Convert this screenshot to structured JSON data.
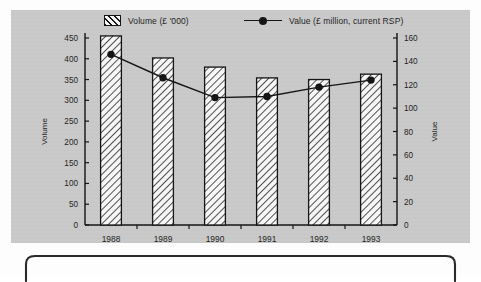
{
  "legend": {
    "items": [
      {
        "label": "Volume (£ '000)",
        "marker": "hatch-swatch"
      },
      {
        "label": "Value (£ million, current RSP)",
        "marker": "line-dot-swatch"
      }
    ]
  },
  "axes": {
    "left_title": "Volume",
    "right_title": "Value",
    "left_ticks": [
      "0",
      "50",
      "100",
      "150",
      "200",
      "250",
      "300",
      "350",
      "400",
      "450"
    ],
    "right_ticks": [
      "0",
      "20",
      "40",
      "60",
      "80",
      "100",
      "120",
      "140",
      "160"
    ]
  },
  "chart_data": {
    "type": "bar",
    "title": "",
    "subtitle": "",
    "xlabel": "",
    "ylabel": "Volume",
    "y2label": "Value",
    "categories": [
      "1988",
      "1989",
      "1990",
      "1991",
      "1992",
      "1993"
    ],
    "series": [
      {
        "name": "Volume (£ '000)",
        "type": "bar",
        "axis": "left",
        "values": [
          455,
          402,
          380,
          354,
          350,
          363
        ],
        "fill": "diagonal-hatch",
        "color": "#111111"
      },
      {
        "name": "Value (£ million, current RSP)",
        "type": "line",
        "axis": "right",
        "values": [
          146,
          126,
          109,
          110,
          118,
          124
        ],
        "marker": "filled-circle",
        "color": "#111111"
      }
    ],
    "ylim": [
      0,
      450
    ],
    "y2lim": [
      0,
      160
    ],
    "ytick_step": 50,
    "y2tick_step": 20,
    "grid": false,
    "legend_position": "top"
  },
  "colors": {
    "panel_background": "#c9c9c9",
    "page_background": "#fdfdfd",
    "ink": "#111111",
    "bar_fill": "#f6f6f6"
  }
}
